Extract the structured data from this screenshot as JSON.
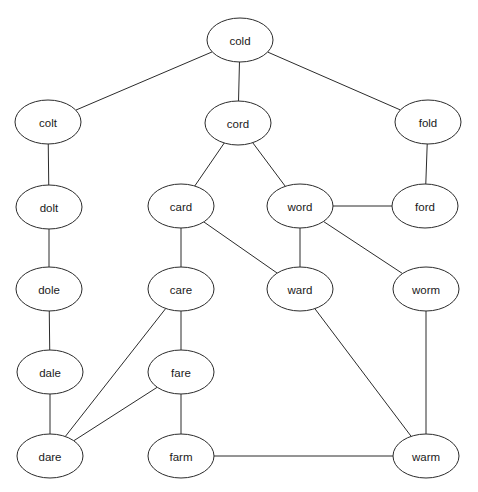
{
  "diagram": {
    "type": "undirected-graph",
    "width": 478,
    "height": 492,
    "background_color": "#ffffff",
    "node_fill": "#ffffff",
    "node_stroke": "#2b2b2b",
    "edge_stroke": "#2b2b2b",
    "label_color": "#1a1a1a"
  },
  "nodes": [
    {
      "id": "cold",
      "label": "cold",
      "cx": 240,
      "cy": 40,
      "rx": 33,
      "ry": 22
    },
    {
      "id": "colt",
      "label": "colt",
      "cx": 48,
      "cy": 122,
      "rx": 33,
      "ry": 22
    },
    {
      "id": "cord",
      "label": "cord",
      "cx": 238,
      "cy": 123,
      "rx": 33,
      "ry": 22
    },
    {
      "id": "fold",
      "label": "fold",
      "cx": 428,
      "cy": 122,
      "rx": 33,
      "ry": 22
    },
    {
      "id": "dolt",
      "label": "dolt",
      "cx": 49,
      "cy": 207,
      "rx": 33,
      "ry": 22
    },
    {
      "id": "card",
      "label": "card",
      "cx": 181,
      "cy": 206,
      "rx": 33,
      "ry": 22
    },
    {
      "id": "word",
      "label": "word",
      "cx": 300,
      "cy": 206,
      "rx": 33,
      "ry": 22
    },
    {
      "id": "ford",
      "label": "ford",
      "cx": 425,
      "cy": 206,
      "rx": 33,
      "ry": 22
    },
    {
      "id": "dole",
      "label": "dole",
      "cx": 49,
      "cy": 289,
      "rx": 33,
      "ry": 22
    },
    {
      "id": "care",
      "label": "care",
      "cx": 181,
      "cy": 289,
      "rx": 33,
      "ry": 22
    },
    {
      "id": "ward",
      "label": "ward",
      "cx": 300,
      "cy": 289,
      "rx": 33,
      "ry": 22
    },
    {
      "id": "worm",
      "label": "worm",
      "cx": 426,
      "cy": 289,
      "rx": 33,
      "ry": 22
    },
    {
      "id": "dale",
      "label": "dale",
      "cx": 50,
      "cy": 372,
      "rx": 33,
      "ry": 22
    },
    {
      "id": "fare",
      "label": "fare",
      "cx": 181,
      "cy": 372,
      "rx": 33,
      "ry": 22
    },
    {
      "id": "dare",
      "label": "dare",
      "cx": 50,
      "cy": 456,
      "rx": 33,
      "ry": 22
    },
    {
      "id": "farm",
      "label": "farm",
      "cx": 181,
      "cy": 456,
      "rx": 33,
      "ry": 22
    },
    {
      "id": "warm",
      "label": "warm",
      "cx": 426,
      "cy": 456,
      "rx": 33,
      "ry": 22
    }
  ],
  "edges": [
    {
      "source": "cold",
      "target": "colt"
    },
    {
      "source": "cold",
      "target": "cord"
    },
    {
      "source": "cold",
      "target": "fold"
    },
    {
      "source": "colt",
      "target": "dolt"
    },
    {
      "source": "cord",
      "target": "card"
    },
    {
      "source": "cord",
      "target": "word"
    },
    {
      "source": "fold",
      "target": "ford"
    },
    {
      "source": "word",
      "target": "ford"
    },
    {
      "source": "dolt",
      "target": "dole"
    },
    {
      "source": "card",
      "target": "care"
    },
    {
      "source": "card",
      "target": "ward"
    },
    {
      "source": "word",
      "target": "ward"
    },
    {
      "source": "word",
      "target": "worm"
    },
    {
      "source": "dole",
      "target": "dale"
    },
    {
      "source": "care",
      "target": "fare"
    },
    {
      "source": "care",
      "target": "dare"
    },
    {
      "source": "dale",
      "target": "dare"
    },
    {
      "source": "fare",
      "target": "dare"
    },
    {
      "source": "fare",
      "target": "farm"
    },
    {
      "source": "ward",
      "target": "warm"
    },
    {
      "source": "worm",
      "target": "warm"
    },
    {
      "source": "farm",
      "target": "warm"
    }
  ]
}
